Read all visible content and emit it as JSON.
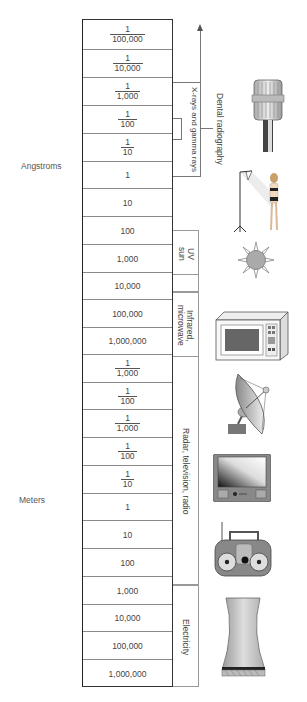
{
  "units": {
    "angstroms": "Angstroms",
    "meters": "Meters"
  },
  "rows": [
    {
      "num": "1",
      "den": "100,000"
    },
    {
      "num": "1",
      "den": "10,000"
    },
    {
      "num": "1",
      "den": "1,000"
    },
    {
      "num": "1",
      "den": "100"
    },
    {
      "num": "1",
      "den": "10"
    },
    {
      "value": "1"
    },
    {
      "value": "10"
    },
    {
      "value": "100"
    },
    {
      "value": "1,000"
    },
    {
      "value": "10,000"
    },
    {
      "value": "100,000"
    },
    {
      "value": "1,000,000"
    },
    {
      "num": "1",
      "den": "1,000"
    },
    {
      "num": "1",
      "den": "100"
    },
    {
      "num": "1",
      "den": "1,000"
    },
    {
      "num": "1",
      "den": "100"
    },
    {
      "num": "1",
      "den": "10"
    },
    {
      "value": "1"
    },
    {
      "value": "10"
    },
    {
      "value": "100"
    },
    {
      "value": "1,000"
    },
    {
      "value": "10,000"
    },
    {
      "value": "100,000"
    },
    {
      "value": "1,000,000"
    }
  ],
  "bands": {
    "xray": "X-rays and gamma rays",
    "uv": "UV\nsun",
    "uv_line1": "UV",
    "uv_line2": "sun",
    "infrared_line1": "Infrared,",
    "infrared_line2": "microwave",
    "radar": "Radar, television, radio",
    "electricity": "Electricity"
  },
  "applications": {
    "dental": "Dental radiography"
  },
  "icons": [
    {
      "name": "dental-xray-tube-icon"
    },
    {
      "name": "photo-lamp-model-icon"
    },
    {
      "name": "sun-icon"
    },
    {
      "name": "microwave-oven-icon"
    },
    {
      "name": "satellite-dish-icon"
    },
    {
      "name": "television-icon"
    },
    {
      "name": "boombox-radio-icon"
    },
    {
      "name": "cooling-tower-icon"
    }
  ]
}
